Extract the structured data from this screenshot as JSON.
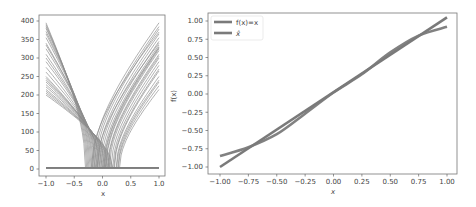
{
  "chart_data": [
    {
      "type": "line",
      "panel": "left",
      "title": "",
      "xlabel": "x",
      "ylabel": "",
      "xlim": [
        -1.1,
        1.1
      ],
      "ylim": [
        -20,
        420
      ],
      "xticks": [
        -1.0,
        -0.5,
        0.0,
        0.5,
        1.0
      ],
      "xtick_labels": [
        "−1.0",
        "−0.5",
        "0.0",
        "0.5",
        "1.0"
      ],
      "yticks": [
        0,
        50,
        100,
        150,
        200,
        250,
        300,
        350,
        400
      ],
      "ytick_labels": [
        "0",
        "50",
        "100",
        "150",
        "200",
        "250",
        "300",
        "350",
        "400"
      ],
      "grid": false,
      "legend": null,
      "description": "Many (~50) ReLU-like hinge basis functions: each curve is zero on one side of a breakpoint in [-0.3, 0.3] and rises (concave) to between ~200 and ~395 at x=-1 or x=1; plus a flat baseline near y=3.",
      "series_breakpoints_left": [
        -0.3,
        -0.28,
        -0.26,
        -0.24,
        -0.22,
        -0.2,
        -0.18,
        -0.16,
        -0.14,
        -0.12,
        -0.1,
        -0.08,
        -0.06,
        -0.04,
        -0.02,
        0.0,
        0.02,
        0.04,
        0.06,
        0.08,
        0.1,
        0.12,
        0.14,
        0.16,
        0.18
      ],
      "series_endvalues_left": [
        395,
        390,
        385,
        380,
        372,
        365,
        355,
        340,
        335,
        325,
        310,
        300,
        290,
        275,
        262,
        250,
        245,
        240,
        235,
        228,
        222,
        215,
        210,
        205,
        200
      ],
      "series_breakpoints_right": [
        -0.18,
        -0.15,
        -0.12,
        -0.09,
        -0.06,
        -0.03,
        0.0,
        0.03,
        0.06,
        0.09,
        0.12,
        0.15,
        0.18,
        0.21,
        0.24,
        0.27,
        0.3,
        -0.2,
        -0.1,
        0.05,
        0.1,
        0.2,
        0.25,
        0.28,
        0.02
      ],
      "series_endvalues_right": [
        395,
        385,
        378,
        365,
        355,
        345,
        335,
        328,
        320,
        310,
        300,
        290,
        280,
        265,
        250,
        235,
        215,
        370,
        340,
        325,
        305,
        270,
        240,
        225,
        330
      ],
      "baseline": {
        "x": [
          -1.0,
          1.0
        ],
        "y": [
          3,
          3
        ]
      }
    },
    {
      "type": "line",
      "panel": "right",
      "title": "",
      "xlabel": "x",
      "ylabel": "f(x)",
      "xlim": [
        -1.1,
        1.1
      ],
      "ylim": [
        -1.1,
        1.1
      ],
      "xticks": [
        -1.0,
        -0.75,
        -0.5,
        -0.25,
        0.0,
        0.25,
        0.5,
        0.75,
        1.0
      ],
      "xtick_labels": [
        "−1.00",
        "−0.75",
        "−0.50",
        "−0.25",
        "0.00",
        "0.25",
        "0.50",
        "0.75",
        "1.00"
      ],
      "yticks": [
        1.0,
        0.75,
        0.5,
        0.25,
        0.0,
        -0.25,
        -0.5,
        -0.75,
        -1.0
      ],
      "ytick_labels": [
        "1.00",
        "0.75",
        "0.50",
        "0.25",
        "0.00",
        "−0.25",
        "−0.50",
        "−0.75",
        "−1.00"
      ],
      "grid": false,
      "legend_position": "upper left",
      "series": [
        {
          "name": "f(x)=x",
          "x": [
            -1.0,
            1.0
          ],
          "y": [
            -1.0,
            1.05
          ]
        },
        {
          "name": "x̂",
          "x": [
            -1.0,
            -0.75,
            -0.5,
            -0.25,
            0.0,
            0.25,
            0.5,
            0.75,
            1.0
          ],
          "y": [
            -0.85,
            -0.73,
            -0.55,
            -0.27,
            0.02,
            0.27,
            0.57,
            0.8,
            0.92
          ]
        }
      ]
    }
  ],
  "legend": {
    "items": [
      {
        "label": "f(x)=x"
      },
      {
        "label": "x̂"
      }
    ]
  },
  "colors": {
    "line": "#7a7a7a",
    "thin_line": "#8c8c8c",
    "axis": "#666666",
    "text": "#444444"
  }
}
